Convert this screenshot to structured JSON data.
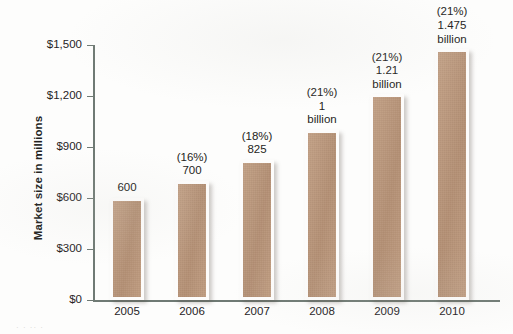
{
  "chart_data": {
    "type": "bar",
    "title": "",
    "subtitle": "",
    "xlabel": "",
    "ylabel": "Market size in millions",
    "categories": [
      "2005",
      "2006",
      "2007",
      "2008",
      "2009",
      "2010"
    ],
    "values": [
      600,
      700,
      825,
      1000,
      1210,
      1475
    ],
    "value_labels": [
      "600",
      "700",
      "825",
      "1 billion",
      "1.21 billion",
      "1.475 billion"
    ],
    "growth_labels": [
      "",
      "(16%)",
      "(18%)",
      "(21%)",
      "(21%)",
      "(21%)"
    ],
    "bar_annotations": [
      "600",
      "(16%)\n700",
      "(18%)\n825",
      "(21%)\n1\nbillion",
      "(21%)\n1.21\nbillion",
      "(21%)\n1.475\nbillion"
    ],
    "yticks": [
      0,
      300,
      600,
      900,
      1200,
      1500
    ],
    "ytick_labels": [
      "$0",
      "$300",
      "$600",
      "$900",
      "$1,200",
      "$1,500"
    ],
    "ylim": [
      0,
      1500
    ],
    "grid": false,
    "legend": false,
    "legend_position": "none",
    "bar_color": "#bd977a",
    "bar_border_color": "#fdfcfb",
    "axis_color": "#6f7a74",
    "text_color": "#26231f"
  },
  "page": {
    "caption_fragment": "· ·   ·· ·"
  }
}
